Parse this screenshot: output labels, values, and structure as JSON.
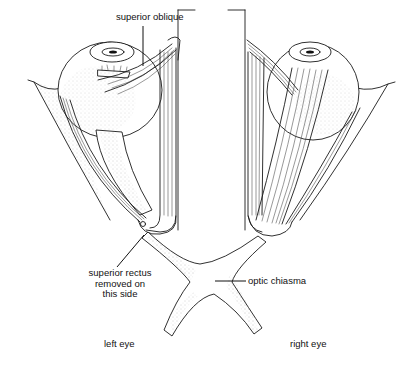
{
  "diagram": {
    "style": "black-and-white line illustration",
    "labels": {
      "superior_oblique": "superior oblique",
      "superior_rectus_removed_line1": "superior rectus",
      "superior_rectus_removed_line2": "removed on",
      "superior_rectus_removed_line3": "this side",
      "optic_chiasma": "optic chiasma",
      "left_eye": "left eye",
      "right_eye": "right eye"
    },
    "structures": [
      {
        "name": "left eyeball",
        "side": "left"
      },
      {
        "name": "right eyeball",
        "side": "right"
      },
      {
        "name": "superior oblique muscle",
        "side": "left"
      },
      {
        "name": "lateral rectus muscle",
        "side": "both"
      },
      {
        "name": "medial rectus muscle",
        "side": "both"
      },
      {
        "name": "superior rectus muscle",
        "side": "right"
      },
      {
        "name": "optic nerve",
        "side": "both"
      },
      {
        "name": "optic chiasma",
        "side": "center"
      },
      {
        "name": "optic tracts",
        "side": "both"
      }
    ]
  }
}
